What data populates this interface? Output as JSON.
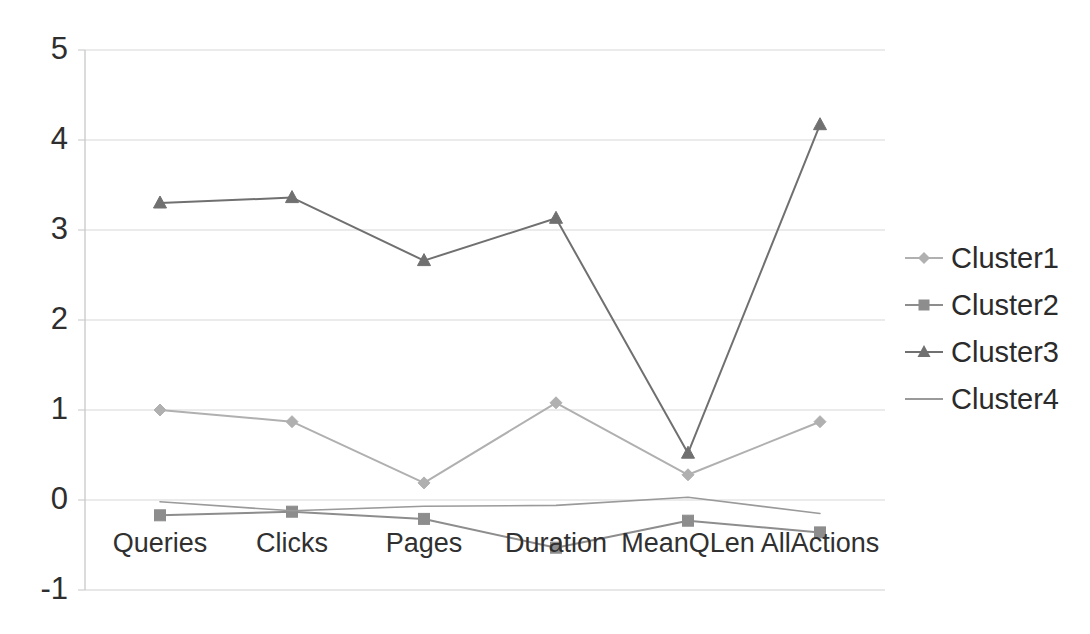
{
  "chart_data": {
    "type": "line",
    "title": "",
    "subtitle": "",
    "xlabel": "",
    "ylabel": "",
    "categories": [
      "Queries",
      "Clicks",
      "Pages",
      "Duration",
      "MeanQLen",
      "AllActions"
    ],
    "ylim": [
      -1,
      5
    ],
    "yticks": [
      -1,
      0,
      1,
      2,
      3,
      4,
      5
    ],
    "ytick_labels": [
      "-1",
      "0",
      "1",
      "2",
      "3",
      "4",
      "5"
    ],
    "grid": true,
    "legend_position": "right",
    "series": [
      {
        "name": "Cluster1",
        "marker": "diamond",
        "color": "#b0b0b0",
        "values": [
          1.0,
          0.87,
          0.19,
          1.08,
          0.28,
          0.87
        ]
      },
      {
        "name": "Cluster2",
        "marker": "square",
        "color": "#8d8d8d",
        "values": [
          -0.17,
          -0.13,
          -0.21,
          -0.53,
          -0.23,
          -0.36
        ]
      },
      {
        "name": "Cluster3",
        "marker": "triangle",
        "color": "#707070",
        "values": [
          3.3,
          3.36,
          2.66,
          3.13,
          0.52,
          4.17
        ]
      },
      {
        "name": "Cluster4",
        "marker": "none",
        "color": "#9a9a9a",
        "values": [
          -0.02,
          -0.12,
          -0.07,
          -0.06,
          0.03,
          -0.15
        ]
      }
    ]
  },
  "legend": {
    "entries": [
      {
        "label": "Cluster1"
      },
      {
        "label": "Cluster2"
      },
      {
        "label": "Cluster3"
      },
      {
        "label": "Cluster4"
      }
    ]
  },
  "axes": {
    "y_labels": [
      "5",
      "4",
      "3",
      "2",
      "1",
      "0",
      "-1"
    ],
    "x_labels": [
      "Queries",
      "Clicks",
      "Pages",
      "Duration",
      "MeanQLen",
      "AllActions"
    ]
  }
}
